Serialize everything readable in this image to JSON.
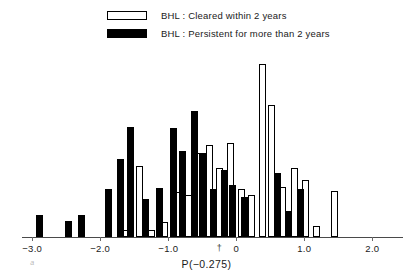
{
  "legend": {
    "items": [
      {
        "style": "open",
        "swatch_name": "legend-swatch-cleared",
        "label": "BHL : Cleared within 2 years"
      },
      {
        "style": "filled",
        "swatch_name": "legend-swatch-persistent",
        "label": "BHL : Persistent for more than 2 years"
      }
    ]
  },
  "axis": {
    "x_title": "P(−0.275)",
    "tick_labels": [
      "−3.0",
      "−2.0",
      "−1.0",
      "0",
      "1.0",
      "2.0"
    ],
    "tick_values": [
      -3.0,
      -2.0,
      -1.0,
      0,
      1.0,
      2.0
    ],
    "zero_marker": "†",
    "alpha_note": "a"
  },
  "colors": {
    "black_series": "#000000",
    "white_series": "#ffffff",
    "outline": "#000000",
    "axis": "#4a4a4a",
    "text": "#1a1a1a"
  },
  "chart_data": {
    "type": "bar",
    "title": "",
    "subtitle": "",
    "xlabel": "P(−0.275)",
    "ylabel": "",
    "xlim": [
      -3.15,
      2.45
    ],
    "ylim": [
      0,
      26
    ],
    "grid": false,
    "legend_position": "top-center",
    "bar_width": 0.055,
    "series": [
      {
        "name": "BHL : Persistent for more than 2 years",
        "fill": "black",
        "points": [
          {
            "x": -2.9,
            "h": 3.2
          },
          {
            "x": -2.46,
            "h": 2.4
          },
          {
            "x": -2.28,
            "h": 3.3
          },
          {
            "x": -1.88,
            "h": 7.1
          },
          {
            "x": -1.7,
            "h": 11.4
          },
          {
            "x": -1.55,
            "h": 16.2
          },
          {
            "x": -1.33,
            "h": 5.6
          },
          {
            "x": -1.13,
            "h": 7.2
          },
          {
            "x": -0.92,
            "h": 16.0
          },
          {
            "x": -0.79,
            "h": 12.6
          },
          {
            "x": -0.62,
            "h": 18.5
          },
          {
            "x": -0.5,
            "h": 12.4
          },
          {
            "x": -0.33,
            "h": 7.0
          },
          {
            "x": -0.17,
            "h": 9.9
          },
          {
            "x": -0.05,
            "h": 7.6
          },
          {
            "x": 0.12,
            "h": 5.9
          },
          {
            "x": 0.6,
            "h": 9.4
          },
          {
            "x": 0.76,
            "h": 3.8
          },
          {
            "x": 0.95,
            "h": 7.1
          }
        ]
      },
      {
        "name": "BHL : Cleared within 2 years",
        "fill": "white",
        "points": [
          {
            "x": -1.62,
            "h": 1.1
          },
          {
            "x": -1.42,
            "h": 10.5
          },
          {
            "x": -1.25,
            "h": 1.0
          },
          {
            "x": -1.06,
            "h": 2.2
          },
          {
            "x": -0.85,
            "h": 6.6
          },
          {
            "x": -0.7,
            "h": 6.1
          },
          {
            "x": -0.55,
            "h": 12.4
          },
          {
            "x": -0.39,
            "h": 13.5
          },
          {
            "x": -0.24,
            "h": 10.2
          },
          {
            "x": -0.09,
            "h": 13.8
          },
          {
            "x": 0.07,
            "h": 7.0
          },
          {
            "x": 0.22,
            "h": 6.2
          },
          {
            "x": 0.38,
            "h": 25.4
          },
          {
            "x": 0.52,
            "h": 19.4
          },
          {
            "x": 0.68,
            "h": 7.3
          },
          {
            "x": 0.85,
            "h": 10.2
          },
          {
            "x": 1.02,
            "h": 8.4
          },
          {
            "x": 1.18,
            "h": 1.6
          },
          {
            "x": 1.45,
            "h": 6.8
          }
        ]
      }
    ]
  }
}
